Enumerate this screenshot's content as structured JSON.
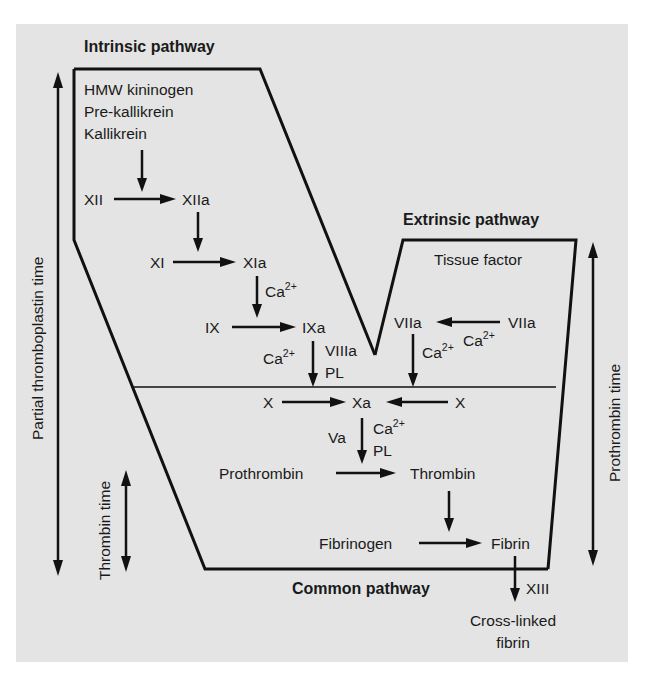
{
  "diagram": {
    "type": "coagulation-cascade",
    "background_color": "#e4e4e4",
    "line_color": "#111111"
  },
  "titles": {
    "intrinsic": "Intrinsic pathway",
    "extrinsic": "Extrinsic pathway",
    "common": "Common pathway"
  },
  "side_labels": {
    "partial_thromboplastin_time": "Partial thromboplastin time",
    "thrombin_time": "Thrombin time",
    "prothrombin_time": "Prothrombin time"
  },
  "intrinsic": {
    "contact_factors": [
      "HMW kininogen",
      "Pre-kallikrein",
      "Kallikrein"
    ],
    "xii": "XII",
    "xiia": "XIIa",
    "xi": "XI",
    "xia": "XIa",
    "ca_xia": "Ca",
    "ix": "IX",
    "ixa": "IXa",
    "ca_ixa": "Ca",
    "viiia": "VIIIa",
    "pl_ixa": "PL"
  },
  "extrinsic": {
    "tissue_factor": "Tissue factor",
    "viia_left": "VIIa",
    "viia_right": "VIIa",
    "ca_upper": "Ca",
    "ca_lower": "Ca"
  },
  "common": {
    "x_left": "X",
    "xa": "Xa",
    "x_right": "X",
    "va": "Va",
    "ca_xa": "Ca",
    "pl_xa": "PL",
    "prothrombin": "Prothrombin",
    "thrombin": "Thrombin",
    "fibrinogen": "Fibrinogen",
    "fibrin": "Fibrin",
    "xiii": "XIII",
    "cross_linked_1": "Cross-linked",
    "cross_linked_2": "fibrin"
  },
  "superscript": "2+"
}
